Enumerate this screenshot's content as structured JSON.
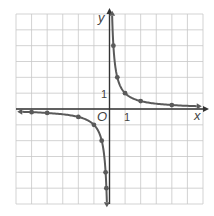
{
  "chart_data": {
    "type": "line",
    "title": "",
    "function": "y = 1/x",
    "xlabel": "x",
    "ylabel": "y",
    "origin_label": "O",
    "tick_labels": {
      "x": "1",
      "y": "1"
    },
    "xlim": [
      -6,
      6
    ],
    "ylim": [
      -6,
      6
    ],
    "grid": true,
    "series": [
      {
        "name": "positive branch",
        "x": [
          0.25,
          0.5,
          1,
          2,
          4
        ],
        "y": [
          4,
          2,
          1,
          0.5,
          0.25
        ],
        "arrows": "both ends"
      },
      {
        "name": "negative branch",
        "x": [
          -5,
          -4,
          -2,
          -1,
          -0.5,
          -0.25,
          -0.2
        ],
        "y": [
          -0.2,
          -0.25,
          -0.5,
          -1,
          -2,
          -4,
          -5
        ],
        "arrows": "both ends"
      }
    ]
  },
  "colors": {
    "grid": "#c8c8c8",
    "axis": "#333333",
    "curve": "#5a5a5a",
    "point": "#5a5a5a"
  }
}
